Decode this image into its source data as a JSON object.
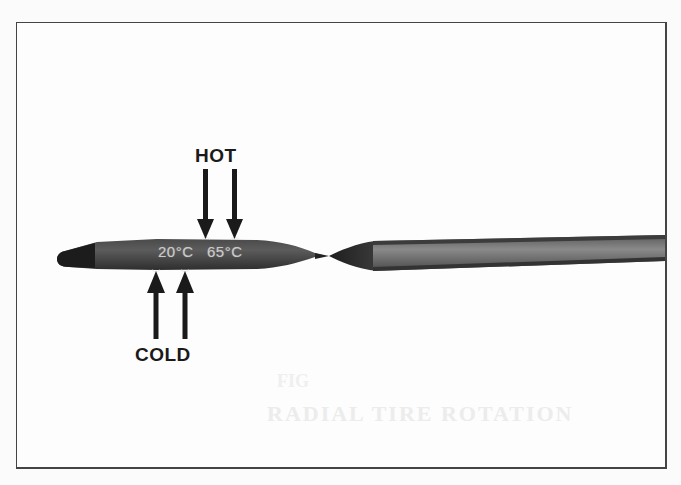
{
  "figure": {
    "labels": {
      "hot": "HOT",
      "cold": "COLD"
    },
    "dipstick_markings": {
      "cold_mark": "20°C",
      "hot_mark": "65°C"
    },
    "background_bleed_text": {
      "line1": "RADIAL TIRE ROTATION",
      "line2": "FIG"
    },
    "colors": {
      "dipstick_dark": "#2a2a2a",
      "dipstick_mid": "#6e6e6e",
      "arrow": "#1a1a1a",
      "frame": "#444444",
      "background": "#fdfdfd"
    }
  }
}
